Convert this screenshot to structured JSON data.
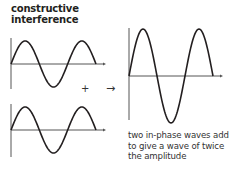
{
  "title_lines": [
    "constructive",
    "interference"
  ],
  "caption_lines": [
    "two in-phase waves add",
    "to give a wave of twice",
    "the amplitude"
  ],
  "plus_symbol": "+",
  "arrow_symbol": "→",
  "colors": {
    "wave": "#231f20",
    "axis": "#555555",
    "background": "#ffffff"
  },
  "waves": [
    {
      "name": "wave-1",
      "axis_y": 64,
      "amplitude": 23,
      "periods": 1.5,
      "x_start": 11,
      "x_end": 96
    },
    {
      "name": "wave-2",
      "axis_y": 130,
      "amplitude": 23,
      "periods": 1.5,
      "x_start": 11,
      "x_end": 96
    },
    {
      "name": "resultant-wave",
      "axis_y": 76,
      "amplitude": 47,
      "periods": 1.5,
      "x_start": 129,
      "x_end": 213
    }
  ]
}
